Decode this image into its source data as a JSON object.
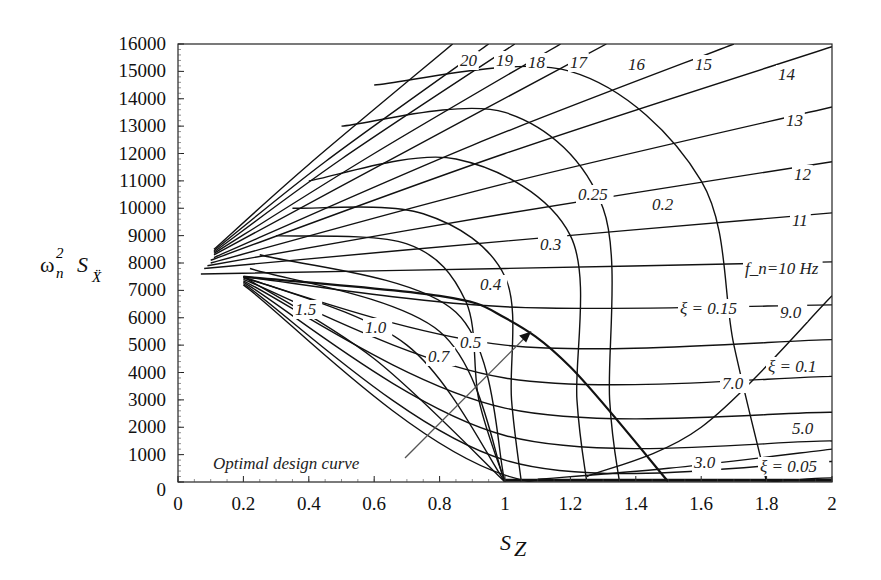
{
  "chart_data": {
    "type": "line",
    "title": "",
    "xlabel": "S_Z",
    "ylabel": "ω_n² S_Ẍ",
    "xlim": [
      0,
      2
    ],
    "ylim": [
      0,
      16000
    ],
    "grid": false,
    "x_ticks": [
      "0",
      "0.2",
      "0.4",
      "0.6",
      "0.8",
      "1",
      "1.2",
      "1.4",
      "1.6",
      "1.8",
      "2"
    ],
    "y_ticks": [
      "0",
      "1000",
      "2000",
      "3000",
      "4000",
      "5000",
      "6000",
      "7000",
      "8000",
      "9000",
      "10000",
      "11000",
      "12000",
      "13000",
      "14000",
      "15000",
      "16000"
    ],
    "frequency_series_label": "f_n (Hz)",
    "frequency_series": [
      {
        "name": "20",
        "label": "20",
        "points": [
          [
            0.11,
            8500
          ],
          [
            0.4,
            11600
          ],
          [
            0.84,
            16000
          ]
        ]
      },
      {
        "name": "19",
        "label": "19",
        "points": [
          [
            0.11,
            8450
          ],
          [
            0.45,
            11700
          ],
          [
            0.95,
            16000
          ]
        ]
      },
      {
        "name": "18",
        "label": "18",
        "points": [
          [
            0.11,
            8400
          ],
          [
            0.5,
            11800
          ],
          [
            1.03,
            16000
          ]
        ]
      },
      {
        "name": "17",
        "label": "17",
        "points": [
          [
            0.11,
            8350
          ],
          [
            0.6,
            12000
          ],
          [
            1.17,
            16000
          ]
        ]
      },
      {
        "name": "16",
        "label": "16",
        "points": [
          [
            0.11,
            8300
          ],
          [
            0.7,
            12100
          ],
          [
            1.31,
            16000
          ]
        ]
      },
      {
        "name": "15",
        "label": "15",
        "points": [
          [
            0.11,
            8200
          ],
          [
            0.9,
            12300
          ],
          [
            1.7,
            16000
          ]
        ]
      },
      {
        "name": "14",
        "label": "14",
        "points": [
          [
            0.1,
            8100
          ],
          [
            1.0,
            12000
          ],
          [
            2.0,
            15900
          ]
        ]
      },
      {
        "name": "13",
        "label": "13",
        "points": [
          [
            0.1,
            8000
          ],
          [
            1.0,
            10900
          ],
          [
            2.0,
            13700
          ]
        ]
      },
      {
        "name": "12",
        "label": "12",
        "points": [
          [
            0.09,
            7900
          ],
          [
            1.0,
            9800
          ],
          [
            2.0,
            11700
          ]
        ]
      },
      {
        "name": "11",
        "label": "11",
        "points": [
          [
            0.08,
            7800
          ],
          [
            1.0,
            8800
          ],
          [
            2.0,
            9830
          ]
        ]
      },
      {
        "name": "10",
        "label": "f_n=10 Hz",
        "points": [
          [
            0.07,
            7600
          ],
          [
            1.0,
            7800
          ],
          [
            2.0,
            8040
          ]
        ]
      },
      {
        "name": "9.0",
        "label": "9.0",
        "points": [
          [
            0.2,
            7500
          ],
          [
            1.0,
            6400
          ],
          [
            2.0,
            6470
          ]
        ]
      },
      {
        "name": "8.0",
        "label": "",
        "points": [
          [
            0.2,
            7450
          ],
          [
            1.0,
            5000
          ],
          [
            2.0,
            5200
          ]
        ]
      },
      {
        "name": "7.0",
        "label": "7.0",
        "points": [
          [
            0.2,
            7400
          ],
          [
            1.0,
            3800
          ],
          [
            2.0,
            3860
          ]
        ]
      },
      {
        "name": "6.0",
        "label": "",
        "points": [
          [
            0.2,
            7350
          ],
          [
            1.0,
            2700
          ],
          [
            2.0,
            2550
          ]
        ]
      },
      {
        "name": "5.0",
        "label": "5.0",
        "points": [
          [
            0.2,
            7300
          ],
          [
            1.0,
            1700
          ],
          [
            2.0,
            1500
          ]
        ]
      },
      {
        "name": "4.0",
        "label": "",
        "points": [
          [
            0.2,
            7250
          ],
          [
            1.0,
            800
          ],
          [
            2.0,
            750
          ]
        ]
      },
      {
        "name": "3.0",
        "label": "3.0",
        "points": [
          [
            0.2,
            7200
          ],
          [
            1.0,
            250
          ],
          [
            2.0,
            150
          ]
        ]
      }
    ],
    "damping_series_label": "ξ",
    "damping_series": [
      {
        "name": "1.5",
        "label": "1.5",
        "points": [
          [
            0.2,
            7500
          ],
          [
            0.6,
            4500
          ],
          [
            1.0,
            0
          ]
        ]
      },
      {
        "name": "1.0",
        "label": "1.0",
        "points": [
          [
            0.2,
            7500
          ],
          [
            0.7,
            5000
          ],
          [
            1.0,
            0
          ]
        ]
      },
      {
        "name": "0.7",
        "label": "0.7",
        "points": [
          [
            0.22,
            7800
          ],
          [
            0.8,
            5500
          ],
          [
            1.0,
            0
          ]
        ]
      },
      {
        "name": "0.5",
        "label": "0.5",
        "points": [
          [
            0.25,
            8300
          ],
          [
            0.85,
            6200
          ],
          [
            1.0,
            0
          ]
        ]
      },
      {
        "name": "0.4",
        "label": "0.4",
        "points": [
          [
            0.3,
            9000
          ],
          [
            0.7,
            8700
          ],
          [
            0.88,
            6600
          ],
          [
            0.92,
            3000
          ],
          [
            1.0,
            0
          ]
        ]
      },
      {
        "name": "0.3",
        "label": "0.3",
        "points": [
          [
            0.35,
            10000
          ],
          [
            0.75,
            9800
          ],
          [
            1.0,
            7500
          ],
          [
            1.02,
            3000
          ],
          [
            1.05,
            0
          ]
        ]
      },
      {
        "name": "0.25",
        "label": "0.25",
        "points": [
          [
            0.4,
            11000
          ],
          [
            0.85,
            11800
          ],
          [
            1.2,
            9000
          ],
          [
            1.22,
            3000
          ],
          [
            1.25,
            0
          ]
        ]
      },
      {
        "name": "0.2",
        "label": "0.2",
        "points": [
          [
            0.5,
            13000
          ],
          [
            1.0,
            13500
          ],
          [
            1.3,
            10000
          ],
          [
            1.32,
            3000
          ],
          [
            1.35,
            0
          ]
        ]
      },
      {
        "name": "0.15",
        "label": "ξ = 0.15",
        "points": [
          [
            0.6,
            14500
          ],
          [
            1.2,
            15000
          ],
          [
            1.6,
            11000
          ],
          [
            1.7,
            5000
          ],
          [
            1.8,
            0
          ]
        ]
      },
      {
        "name": "0.1",
        "label": "ξ = 0.1",
        "points": [
          [
            1.25,
            200
          ],
          [
            1.6,
            2000
          ],
          [
            2.0,
            6800
          ]
        ]
      },
      {
        "name": "0.05",
        "label": "ξ = 0.05",
        "points": [
          [
            1.1,
            100
          ],
          [
            1.5,
            500
          ],
          [
            2.0,
            1200
          ]
        ]
      }
    ],
    "optimal_design_curve": {
      "label": "Optimal design curve",
      "points": [
        [
          0.2,
          7500
        ],
        [
          0.8,
          6800
        ],
        [
          1.0,
          6000
        ],
        [
          1.2,
          4200
        ],
        [
          1.5,
          0
        ]
      ]
    },
    "annotations": [
      {
        "text": "Optimal design curve",
        "x": 0.32,
        "y": 1500,
        "arrow_to": [
          1.08,
          5500
        ]
      }
    ]
  },
  "axis": {
    "x_title_main": "S",
    "x_title_sub": "Z",
    "y_title_main": "ω",
    "y_title_sup": "2",
    "y_title_n": "n",
    "y_title_S": "S",
    "y_title_sub": "Ẍ"
  }
}
